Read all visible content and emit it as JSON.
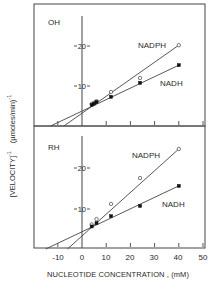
{
  "chart_data": [
    {
      "type": "scatter",
      "panel_label": "OH",
      "title": "",
      "xlabel": "NUCLEOTIDE CONCENTRATION , (mM)",
      "ylabel": "[VELOCITY]^-1 , (µmoles/min)^-1",
      "xlim": [
        -17,
        50
      ],
      "ylim": [
        0,
        30
      ],
      "y_ticks": [
        10,
        20
      ],
      "x_ticks": [
        -10,
        0,
        10,
        20,
        30,
        40,
        50
      ],
      "grid": false,
      "series": [
        {
          "name": "NADPH",
          "marker": "open-circle",
          "x": [
            4,
            5,
            6,
            12,
            24,
            40
          ],
          "y": [
            5.5,
            5.8,
            6.2,
            8.5,
            12.0,
            20.2
          ],
          "fit_line": {
            "x_intercept": -7.5,
            "x_end": 40,
            "y_end": 20.2
          }
        },
        {
          "name": "NADH",
          "marker": "filled-square",
          "x": [
            4,
            5,
            6,
            12,
            24,
            40
          ],
          "y": [
            5.3,
            5.6,
            6.0,
            7.3,
            10.8,
            15.2
          ],
          "fit_line": {
            "x_intercept": -13,
            "x_end": 40,
            "y_end": 15.2
          }
        }
      ]
    },
    {
      "type": "scatter",
      "panel_label": "RH",
      "title": "",
      "xlabel": "NUCLEOTIDE CONCENTRATION , (mM)",
      "ylabel": "[VELOCITY]^-1 , (µmoles/min)^-1",
      "xlim": [
        -17,
        50
      ],
      "ylim": [
        0,
        30
      ],
      "y_ticks": [
        10,
        20
      ],
      "x_ticks": [
        -10,
        0,
        10,
        20,
        30,
        40,
        50
      ],
      "grid": false,
      "series": [
        {
          "name": "NADPH",
          "marker": "open-circle",
          "x": [
            4,
            6,
            12,
            24,
            40
          ],
          "y": [
            6.0,
            7.3,
            11.0,
            17.3,
            24.4
          ],
          "fit_line": {
            "x_intercept": -6,
            "x_end": 40,
            "y_end": 24.4
          }
        },
        {
          "name": "NADH",
          "marker": "filled-square",
          "x": [
            4,
            6,
            12,
            24,
            40
          ],
          "y": [
            5.5,
            6.3,
            8.0,
            10.5,
            15.4
          ],
          "fit_line": {
            "x_intercept": -15,
            "x_end": 40,
            "y_end": 15.4
          }
        }
      ]
    }
  ],
  "labels": {
    "panel_top": "OH",
    "panel_bottom": "RH",
    "series_nadph": "NADPH",
    "series_nadh": "NADH",
    "y_tick_10": "10",
    "y_tick_20": "20",
    "x_ticks": [
      "-10",
      "0",
      "10",
      "20",
      "30",
      "40",
      "50"
    ],
    "x_axis_title": "NUCLEOTIDE  CONCENTRATION , (mM)",
    "y_axis_title_left": "[VELOCITY]",
    "y_axis_title_exp1": "-1",
    "y_axis_title_right": "(µmoles/min)",
    "y_axis_title_exp2": "-1"
  }
}
